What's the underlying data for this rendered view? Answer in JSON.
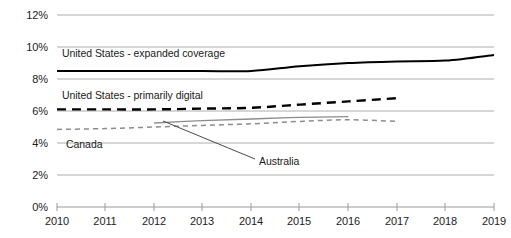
{
  "chart_data": {
    "type": "line",
    "title": "",
    "xlabel": "",
    "ylabel": "",
    "x": [
      2010,
      2011,
      2012,
      2013,
      2014,
      2015,
      2016,
      2017,
      2018,
      2019
    ],
    "xticklabels": [
      "2010",
      "2011",
      "2012",
      "2013",
      "2014",
      "2015",
      "2016",
      "2017",
      "2018",
      "2019"
    ],
    "yticklabels": [
      "0%",
      "2%",
      "4%",
      "6%",
      "8%",
      "10%",
      "12%"
    ],
    "ytickvalues": [
      0,
      2,
      4,
      6,
      8,
      10,
      12
    ],
    "ylim": [
      0,
      12
    ],
    "xlim": [
      2010,
      2019
    ],
    "grid": "horizontal",
    "legend": "inline-annotations",
    "series": [
      {
        "name": "United States - expanded coverage",
        "style": "solid",
        "color": "#000000",
        "width": 2.0,
        "x": [
          2010,
          2011,
          2012,
          2013,
          2014,
          2015,
          2016,
          2017,
          2018,
          2019
        ],
        "values": [
          8.5,
          8.5,
          8.5,
          8.5,
          8.5,
          8.8,
          9.0,
          9.1,
          9.15,
          9.5
        ]
      },
      {
        "name": "United States - primarily digital",
        "style": "dashed",
        "color": "#000000",
        "width": 2.4,
        "x": [
          2010,
          2011,
          2012,
          2013,
          2014,
          2015,
          2016,
          2017
        ],
        "values": [
          6.1,
          6.1,
          6.1,
          6.15,
          6.2,
          6.4,
          6.6,
          6.8
        ]
      },
      {
        "name": "Canada",
        "style": "dashed",
        "color": "#8c8c8c",
        "width": 1.5,
        "x": [
          2010,
          2011,
          2012,
          2013,
          2014,
          2015,
          2016,
          2017
        ],
        "values": [
          4.85,
          4.9,
          5.0,
          5.1,
          5.2,
          5.35,
          5.45,
          5.35
        ]
      },
      {
        "name": "Australia",
        "style": "solid",
        "color": "#8c8c8c",
        "width": 1.3,
        "x": [
          2012,
          2013,
          2014,
          2015,
          2016
        ],
        "values": [
          5.25,
          5.4,
          5.5,
          5.6,
          5.65
        ]
      }
    ],
    "annotations": [
      {
        "name": "United States - expanded coverage",
        "x": 62,
        "y": 47
      },
      {
        "name": "United States - primarily digital",
        "x": 62,
        "y": 89
      },
      {
        "name": "Canada",
        "x": 66,
        "y": 138
      },
      {
        "name": "Australia",
        "x": 259,
        "y": 155
      }
    ],
    "leader_line": {
      "from_x": 163,
      "from_y": 121,
      "to_x": 255,
      "to_y": 159
    }
  },
  "axis": {
    "gridline_color": "#aeaeae",
    "tick_color": "#9a9a9a",
    "label_color": "#222222"
  }
}
